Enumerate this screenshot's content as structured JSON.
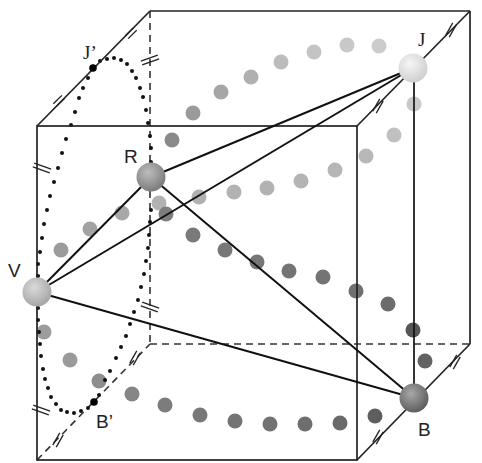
{
  "figure": {
    "width": 482,
    "height": 463
  },
  "labels": {
    "J": "J",
    "J_prime": "J’",
    "R": "R",
    "V": "V",
    "B": "B",
    "B_prime": "B’"
  },
  "colors": {
    "edge": "#222222",
    "sphere_J": "#e0e0e0",
    "sphere_R": "#8e8e8e",
    "sphere_V": "#bdbdbd",
    "sphere_B": "#7a7a7a",
    "dot_light": "#c4c4c4",
    "dot_mid": "#a2a2a2",
    "dot_dark": "#6e6e6e"
  },
  "cube": {
    "front": [
      [
        37,
        126
      ],
      [
        357,
        126
      ],
      [
        357,
        460
      ],
      [
        37,
        460
      ]
    ],
    "back": [
      [
        150,
        11
      ],
      [
        470,
        11
      ],
      [
        470,
        344
      ],
      [
        150,
        344
      ]
    ],
    "hidden_edges": [
      "back-left-vertical",
      "back-bottom",
      "front-bottom-left-to-back-bottom-left"
    ]
  },
  "points": {
    "J": {
      "x": 413,
      "y": 68,
      "r": 14
    },
    "R": {
      "x": 151,
      "y": 177,
      "r": 14
    },
    "V": {
      "x": 37,
      "y": 292,
      "r": 14
    },
    "B": {
      "x": 414,
      "y": 398,
      "r": 14
    },
    "J_prime": {
      "x": 93,
      "y": 68
    },
    "B_prime": {
      "x": 94,
      "y": 402
    }
  },
  "connections": [
    [
      "V",
      "R"
    ],
    [
      "V",
      "J"
    ],
    [
      "V",
      "B"
    ],
    [
      "R",
      "J"
    ],
    [
      "R",
      "B"
    ],
    [
      "J",
      "B"
    ]
  ],
  "tick_marks": "double-slash congruence marks on cube edges"
}
